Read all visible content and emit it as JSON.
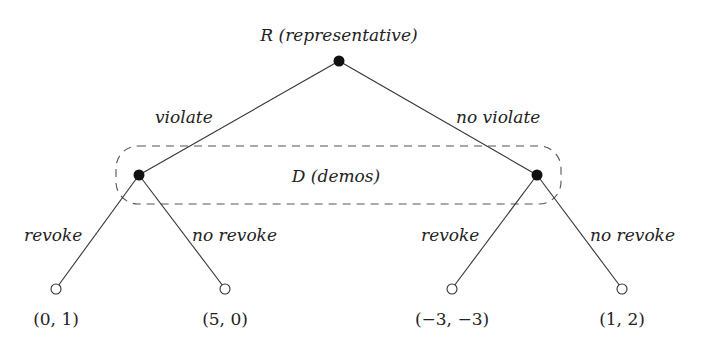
{
  "diagram": {
    "type": "extensive-form game tree",
    "root": {
      "label": "R (representative)",
      "x": 339,
      "y": 61
    },
    "information_set": {
      "label": "D (demos)",
      "x": 116,
      "y": 146,
      "width": 445,
      "height": 58
    },
    "decision_nodes": [
      {
        "id": "d1",
        "x": 139,
        "y": 175
      },
      {
        "id": "d2",
        "x": 537,
        "y": 175
      }
    ],
    "root_edges": [
      {
        "label": "violate",
        "to": "d1",
        "label_x": 155,
        "label_y": 123
      },
      {
        "label": "no violate",
        "to": "d2",
        "label_x": 456,
        "label_y": 123
      }
    ],
    "leaf_edges": [
      {
        "label": "revoke",
        "from": "d1",
        "x": 56,
        "y": 289,
        "label_x": 24,
        "label_y": 241
      },
      {
        "label": "no revoke",
        "from": "d1",
        "x": 225,
        "y": 289,
        "label_x": 192,
        "label_y": 241
      },
      {
        "label": "revoke",
        "from": "d2",
        "x": 452,
        "y": 289,
        "label_x": 421,
        "label_y": 241
      },
      {
        "label": "no revoke",
        "from": "d2",
        "x": 622,
        "y": 289,
        "label_x": 590,
        "label_y": 241
      }
    ],
    "payoffs": [
      {
        "text": "(0, 1)",
        "x": 56,
        "y": 325
      },
      {
        "text": "(5, 0)",
        "x": 225,
        "y": 325
      },
      {
        "text": "(−3, −3)",
        "x": 452,
        "y": 325
      },
      {
        "text": "(1, 2)",
        "x": 622,
        "y": 325
      }
    ]
  }
}
